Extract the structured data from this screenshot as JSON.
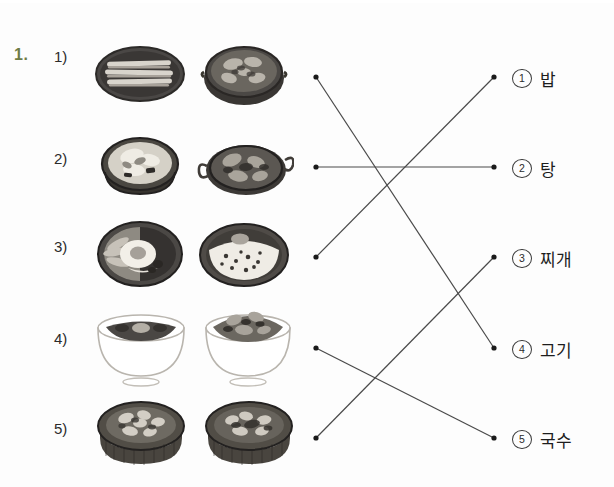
{
  "worksheet": {
    "question_number": "1.",
    "accent_color": "#6e7b45",
    "line_color": "#4a4a4a",
    "dot_color": "#1a1a1a"
  },
  "left_items": [
    {
      "label": "1)",
      "food": "고기",
      "images": [
        "grilled-pork-belly-on-plate",
        "grilled-meat-in-pan"
      ]
    },
    {
      "label": "2)",
      "food": "탕",
      "images": [
        "soup-in-metal-bowl",
        "spicy-stew-in-shallow-pot"
      ]
    },
    {
      "label": "3)",
      "food": "밥",
      "images": [
        "bibimbap-with-fried-egg",
        "rice-bowl-with-egg-and-toppings"
      ]
    },
    {
      "label": "4)",
      "food": "국수",
      "images": [
        "black-bean-noodles-bowl",
        "mixed-noodles-bowl"
      ]
    },
    {
      "label": "5)",
      "food": "찌개",
      "images": [
        "stew-in-stone-pot-left",
        "stew-in-stone-pot-right"
      ]
    }
  ],
  "right_options": [
    {
      "marker": "①",
      "number": "1",
      "label": "밥"
    },
    {
      "marker": "②",
      "number": "2",
      "label": "탕"
    },
    {
      "marker": "③",
      "number": "3",
      "label": "찌개"
    },
    {
      "marker": "④",
      "number": "4",
      "label": "고기"
    },
    {
      "marker": "⑤",
      "number": "5",
      "label": "국수"
    }
  ],
  "connections": [
    {
      "from": 1,
      "to": 4
    },
    {
      "from": 2,
      "to": 2
    },
    {
      "from": 3,
      "to": 1
    },
    {
      "from": 4,
      "to": 5
    },
    {
      "from": 5,
      "to": 3
    }
  ],
  "geometry": {
    "left_dot_x": 316,
    "right_dot_x": 494,
    "row_y": [
      77,
      167,
      257,
      348,
      438
    ]
  }
}
